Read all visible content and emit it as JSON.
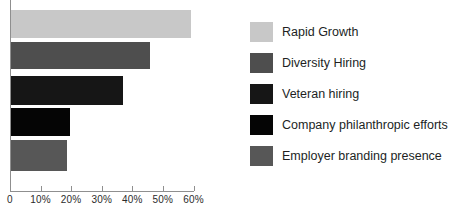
{
  "chart_data": {
    "type": "bar",
    "orientation": "horizontal",
    "title": "",
    "xlabel": "",
    "ylabel": "",
    "grid": false,
    "legend_position": "right",
    "xlim": [
      0,
      60
    ],
    "xticks": [
      0,
      10,
      20,
      30,
      40,
      50,
      60
    ],
    "xtick_labels": [
      "0",
      "10%",
      "20%",
      "30%",
      "40%",
      "50%",
      "60%"
    ],
    "categories": [
      "Rapid Growth",
      "Diversity Hiring",
      "Veteran hiring",
      "Company philanthropic efforts",
      "Employer branding presence"
    ],
    "values": [
      59,
      45.5,
      36.5,
      19.4,
      18.4
    ],
    "colors": [
      "#c8c8c8",
      "#4e4e4e",
      "#161616",
      "#050505",
      "#575757"
    ]
  },
  "legend": {
    "items": [
      {
        "label": "Rapid Growth",
        "color": "#c8c8c8"
      },
      {
        "label": "Diversity Hiring",
        "color": "#4e4e4e"
      },
      {
        "label": "Veteran hiring",
        "color": "#161616"
      },
      {
        "label": "Company philanthropic efforts",
        "color": "#050505"
      },
      {
        "label": "Employer branding presence",
        "color": "#575757"
      }
    ]
  },
  "axis": {
    "tick_labels": [
      "0",
      "10%",
      "20%",
      "30%",
      "40%",
      "50%",
      "60%"
    ],
    "line_color": "#8f8f8f"
  }
}
